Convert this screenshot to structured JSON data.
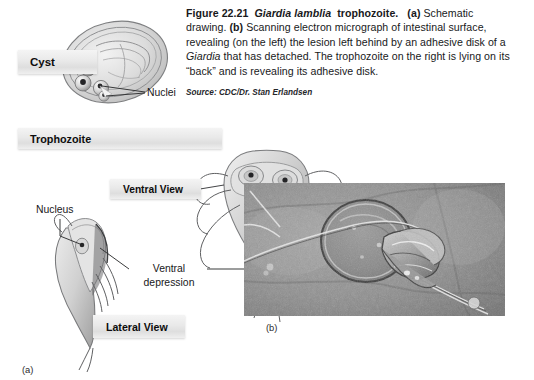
{
  "figure": {
    "number": "Figure 22.21",
    "species": "Giardia lamblia",
    "title_tail": "trophozoite.",
    "part_a_marker": "(a)",
    "part_b_marker": "(b)",
    "caption_a_text": "Schematic drawing.",
    "caption_b_text": "Scanning electron micrograph of intestinal surface, revealing (on the left) the lesion left behind by an adhesive disk of a ",
    "caption_b_italic": "Giardia",
    "caption_b_tail": " that has detached. The trophozoite on the right is lying on its “back” and is revealing its adhesive disk.",
    "source": "Source: CDC/Dr. Stan Erlandsen",
    "panel_a_letter": "(a)",
    "panel_b_letter": "(b)"
  },
  "labels": {
    "cyst": "Cyst",
    "trophozoite": "Trophozoite",
    "ventral_view": "Ventral View",
    "lateral_view": "Lateral View",
    "nuclei": "Nuclei",
    "nucleus": "Nucleus",
    "ventral_depression": "Ventral\ndepression"
  },
  "colors": {
    "page_background": "#ffffff",
    "text": "#17181a",
    "bar_light": "#f4f4f4",
    "bar_dark": "#dedede",
    "line": "#3a3b3d",
    "organism_fill": "#d9d9d9",
    "organism_stroke": "#6e6f71",
    "micrograph_base": "#8d8d8d"
  },
  "icons": {
    "cyst_drawing": "cyst-oval-drawing",
    "ventral_trophozoite": "ventral-trophozoite-drawing",
    "lateral_trophozoite": "lateral-trophozoite-drawing",
    "sem_micrograph": "sem-micrograph-photo"
  }
}
